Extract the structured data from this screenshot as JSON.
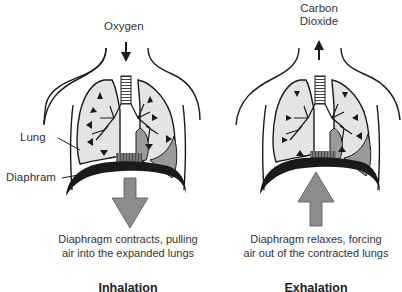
{
  "figure": {
    "panels": [
      {
        "id": "inhalation",
        "title": "Inhalation",
        "gas_label": "Oxygen",
        "gas_flow_direction": "in",
        "diaphragm_movement": "down",
        "caption_line1": "Diaphragm contracts, pulling",
        "caption_line2": "air into the expanded lungs",
        "part_labels": {
          "lung": "Lung",
          "diaphragm": "Diaphram"
        }
      },
      {
        "id": "exhalation",
        "title": "Exhalation",
        "gas_label_line1": "Carbon",
        "gas_label_line2": "Dioxide",
        "gas_flow_direction": "out",
        "diaphragm_movement": "up",
        "caption_line1": "Diaphragm relaxes, forcing",
        "caption_line2": "air out of the contracted lungs"
      }
    ],
    "colors": {
      "outline": "#1a1a1a",
      "lung_fill": "#e4e4e4",
      "heart_fill": "#9a9a9a",
      "arrow_fill": "#8c8c8c",
      "diaphragm": "#1a1a1a"
    }
  }
}
